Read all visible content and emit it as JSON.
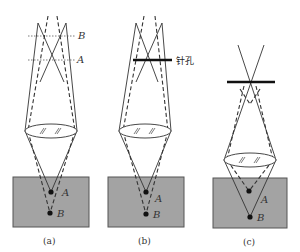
{
  "figure": {
    "colors": {
      "specimen_fill": "#a3a3a3",
      "specimen_stroke": "#555555",
      "line": "#333333",
      "pinhole": "#111111"
    },
    "panels": [
      {
        "id": "a",
        "caption": "(a)",
        "points": [
          {
            "label": "A"
          },
          {
            "label": "B"
          }
        ],
        "focal_planes": [
          {
            "label": "B"
          },
          {
            "label": "A"
          }
        ]
      },
      {
        "id": "b",
        "caption": "(b)",
        "points": [
          {
            "label": "A"
          },
          {
            "label": "B"
          }
        ],
        "pinhole_label": "针孔"
      },
      {
        "id": "c",
        "caption": "(c)",
        "points": [
          {
            "label": "A"
          },
          {
            "label": "B"
          }
        ]
      }
    ]
  }
}
